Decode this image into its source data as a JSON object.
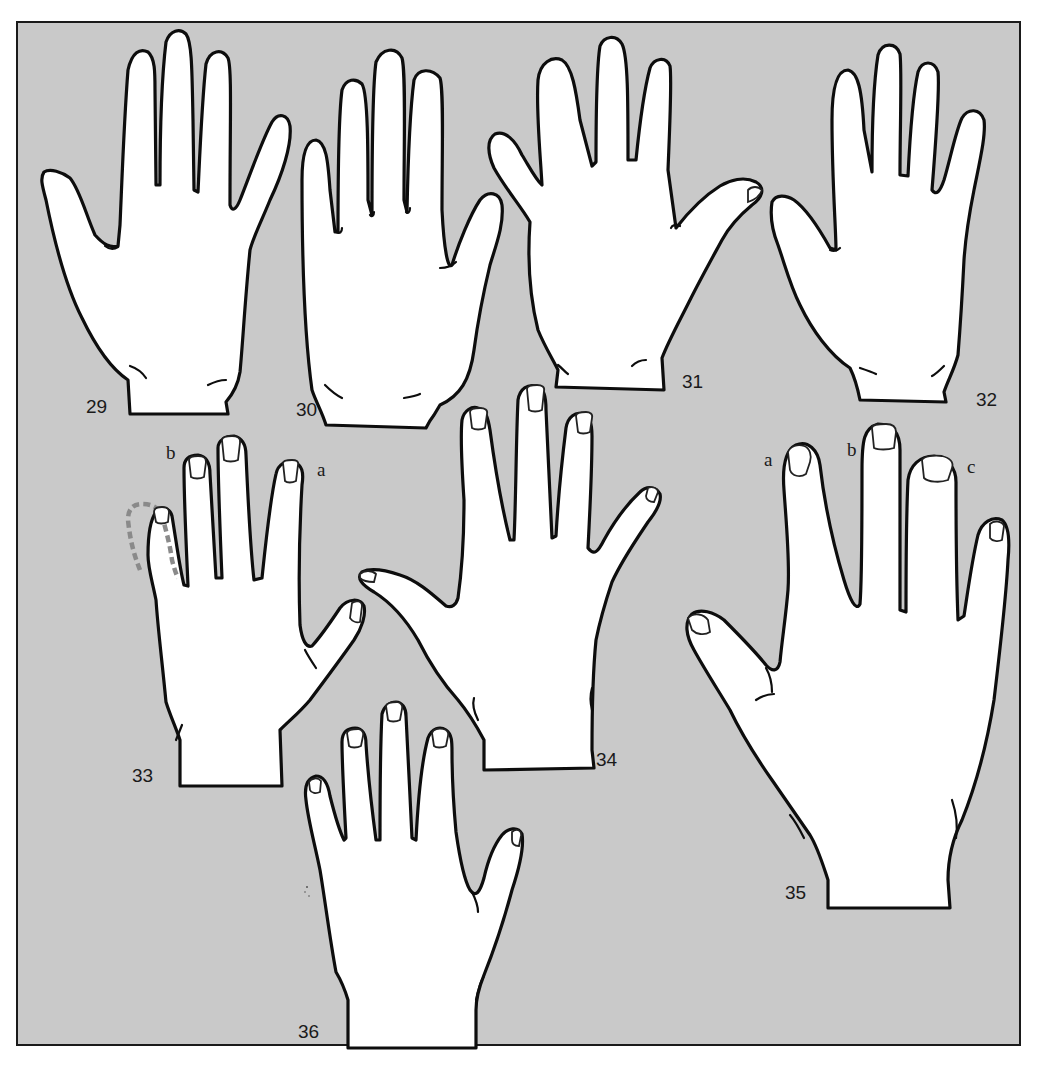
{
  "figure": {
    "background_color": "#c9c9c9",
    "outline_color": "#0d0d0d",
    "fill_color": "#ffffff",
    "dashed_outline_color": "#8a8a8a",
    "hands": [
      {
        "number": "29",
        "view": "palm",
        "fingers": "long, narrow palm"
      },
      {
        "number": "30",
        "view": "palm",
        "fingers": "long fingers, long palm"
      },
      {
        "number": "31",
        "view": "palm",
        "fingers": "short fingers, broad palm"
      },
      {
        "number": "32",
        "view": "palm",
        "fingers": "tapering fingers"
      },
      {
        "number": "33",
        "view": "back",
        "letters": [
          "a",
          "b"
        ],
        "note": "dashed outline around little finger"
      },
      {
        "number": "34",
        "view": "back",
        "fingers": "spread fingers, thumb extended"
      },
      {
        "number": "35",
        "view": "back",
        "letters": [
          "a",
          "b",
          "c"
        ],
        "note": "nail shapes labelled"
      },
      {
        "number": "36",
        "view": "back",
        "fingers": "small hand"
      }
    ]
  },
  "labels": {
    "h29": "29",
    "h30": "30",
    "h31": "31",
    "h32": "32",
    "h33": "33",
    "h34": "34",
    "h35": "35",
    "h36": "36",
    "h33_a": "a",
    "h33_b": "b",
    "h35_a": "a",
    "h35_b": "b",
    "h35_c": "c"
  }
}
